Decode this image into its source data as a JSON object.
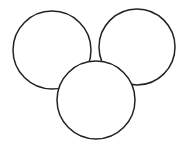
{
  "diagram": {
    "type": "overlapping-circles",
    "stroke_color": "#222222",
    "fill_color": "#ffffff",
    "background": "#ffffff",
    "circles": [
      {
        "id": "left",
        "cx": 52,
        "cy": 50,
        "r": 39
      },
      {
        "id": "right",
        "cx": 137,
        "cy": 47,
        "r": 38
      },
      {
        "id": "bottom",
        "cx": 96,
        "cy": 100,
        "r": 39
      }
    ]
  }
}
